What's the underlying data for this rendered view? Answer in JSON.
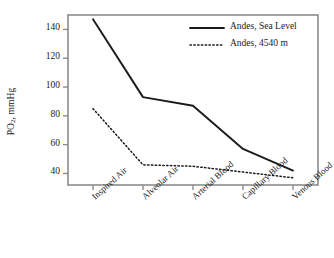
{
  "chart_data": {
    "type": "line",
    "title": "",
    "xlabel": "",
    "ylabel": "PO2, mmHg",
    "ylabel_base": "PO",
    "ylabel_sub": "2",
    "ylabel_rest": ", mmHg",
    "categories": [
      "Inspired Air",
      "Alveolar Air",
      "Arterial Blood",
      "Capillary Blood",
      "Venous Blood"
    ],
    "ylim": [
      32,
      150
    ],
    "yticks": [
      40,
      60,
      80,
      100,
      120,
      140
    ],
    "ytick_labels": [
      "40",
      "60",
      "80",
      "100",
      "120",
      "140"
    ],
    "grid": false,
    "legend_position": "top-right",
    "series": [
      {
        "name": "Andes, Sea Level",
        "style": "solid",
        "color": "#1a1a1a",
        "values": [
          147,
          93,
          87,
          57,
          42
        ]
      },
      {
        "name": "Andes, 4540 m",
        "style": "dotted",
        "color": "#1a1a1a",
        "values": [
          85,
          46,
          45,
          41,
          37
        ]
      }
    ]
  },
  "axes": {
    "frame_color": "#8c8c8c",
    "tick_color": "#8c8c8c"
  },
  "legend": {
    "entries": [
      {
        "label": "Andes, Sea Level",
        "style": "solid"
      },
      {
        "label": "Andes, 4540 m",
        "style": "dotted"
      }
    ]
  }
}
